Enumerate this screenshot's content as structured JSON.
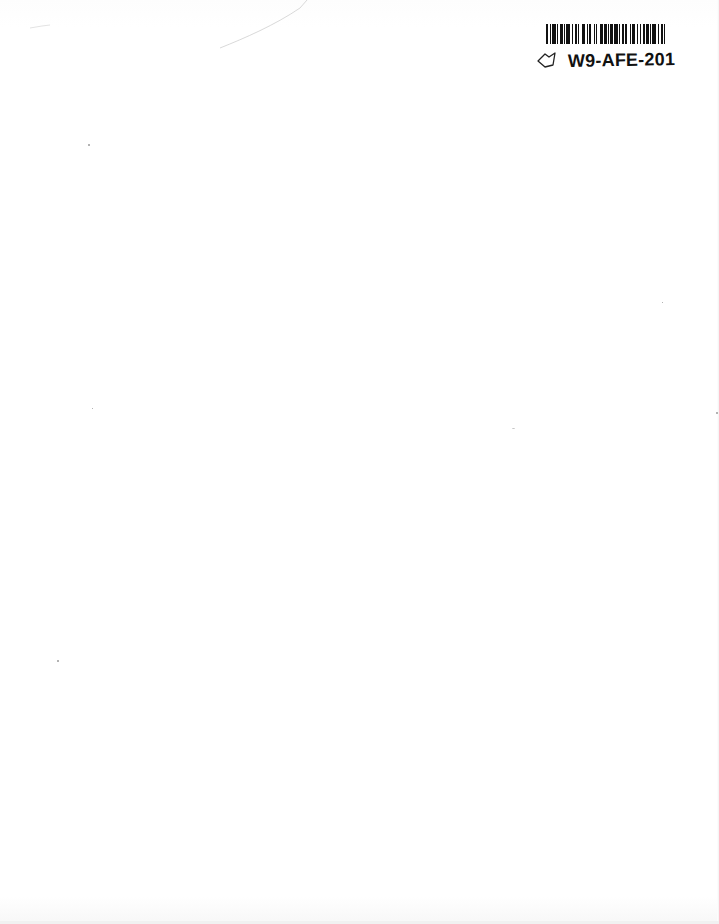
{
  "document": {
    "type": "scanned blank page",
    "background_color": "#ffffff"
  },
  "barcode_label": {
    "code_text": "W9-AFE-201",
    "icon": "bookmark-outline-icon",
    "bar_color": "#111111"
  },
  "marks": {
    "pencil_stroke": "faint diagonal stroke near top left",
    "specks": [
      {
        "x": 88,
        "y": 144
      },
      {
        "x": 92,
        "y": 408
      },
      {
        "x": 57,
        "y": 660
      },
      {
        "x": 662,
        "y": 302
      },
      {
        "x": 512,
        "y": 428
      },
      {
        "x": 716,
        "y": 412
      }
    ]
  }
}
